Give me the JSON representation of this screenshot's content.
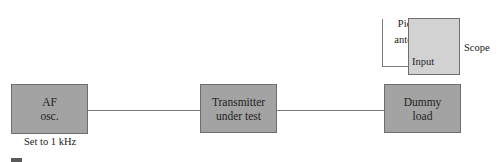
{
  "diagram": {
    "blocks": {
      "af_osc": {
        "line1": "AF",
        "line2": "osc."
      },
      "transmitter": {
        "line1": "Transmitter",
        "line2": "under test"
      },
      "dummy_load": {
        "line1": "Dummy",
        "line2": "load"
      },
      "scope": {
        "input_label": "Input"
      }
    },
    "labels": {
      "af_setting": "Set to 1 kHz",
      "pickup_line1": "Pickup",
      "pickup_line2": "antenna",
      "scope": "Scope"
    },
    "colors": {
      "dark_block": "#a3a3a3",
      "light_block": "#d2d2d2",
      "wire": "#7a7a7a"
    }
  }
}
